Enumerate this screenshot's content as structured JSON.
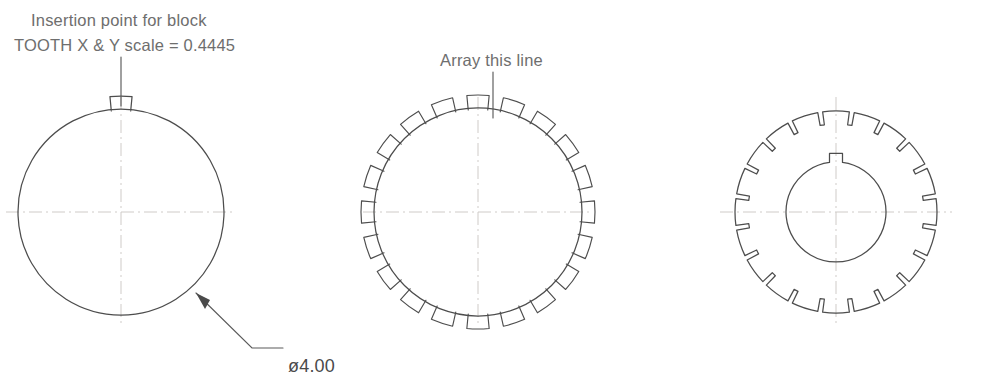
{
  "figure": {
    "background_color": "#ffffff",
    "line_color": "#4d4d4d",
    "text_color": "#6e6e6e",
    "centerline_color": "#c9c5c2"
  },
  "annotations": {
    "insertion_note_line1": "Insertion point for block",
    "insertion_note_line2": "TOOTH X & Y scale = 0.4445",
    "array_note": "Array this line",
    "diameter_dimension": "ø4.00"
  },
  "views": [
    {
      "id": "view-base-circle",
      "name": "base-circle-with-single-tooth",
      "center_x": 121,
      "center_y": 212,
      "radius": 103,
      "tooth_count": 1,
      "has_centerlines": true,
      "has_bore": false
    },
    {
      "id": "view-arrayed-teeth",
      "name": "circle-with-arrayed-teeth",
      "center_x": 478,
      "center_y": 212,
      "radius": 104,
      "tooth_count": 20,
      "has_centerlines": true,
      "has_bore": false
    },
    {
      "id": "view-finished-gear",
      "name": "finished-gear-with-keyed-bore",
      "center_x": 836,
      "center_y": 212,
      "radius": 101,
      "tooth_count": 20,
      "has_centerlines": true,
      "has_bore": true,
      "bore_radius": 50,
      "keyway": true
    }
  ],
  "geometry": {
    "tooth_half_angle_deg": 7.6,
    "tooth_height": 13,
    "root_inset": 13,
    "keyway_width": 13,
    "keyway_height": 9
  },
  "leaders": [
    {
      "name": "insertion-point-leader",
      "from_x": 121,
      "from_y": 57,
      "to_x": 121,
      "to_y": 106,
      "arrow": false
    },
    {
      "name": "array-line-leader",
      "from_x": 493,
      "from_y": 72,
      "to_x": 493,
      "to_y": 118,
      "arrow": false
    },
    {
      "name": "diameter-leader",
      "points": "196,293 252,348 283,348",
      "arrow": true,
      "arrow_x": 196,
      "arrow_y": 293,
      "arrow_angle_deg": 225
    }
  ]
}
